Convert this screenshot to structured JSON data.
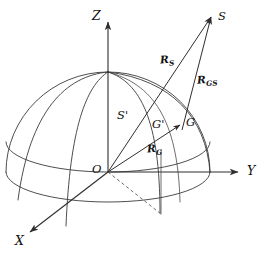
{
  "figure": {
    "background_color": "#ffffff",
    "line_color": "#3a3a3a",
    "label_color": "#111111",
    "width": 266,
    "height": 270
  },
  "axes": {
    "x": {
      "label": "X",
      "label_x": 15,
      "label_y": 236
    },
    "y": {
      "label": "Y",
      "label_x": 247,
      "label_y": 165
    },
    "z": {
      "label": "Z",
      "label_x": 92,
      "label_y": 16
    }
  },
  "points": {
    "origin": {
      "label": "O",
      "label_x": 92,
      "label_y": 165
    },
    "satellite": {
      "label": "S",
      "label_x": 217,
      "label_y": 11
    },
    "subsatellite": {
      "label": "S'",
      "label_x": 118,
      "label_y": 110
    },
    "ground_projected": {
      "label": "G'",
      "label_x": 152,
      "label_y": 120
    },
    "ground_station": {
      "label": "G",
      "label_x": 185,
      "label_y": 119
    }
  },
  "vectors": {
    "r_s": {
      "base": "R",
      "sub": "S",
      "label_x": 160,
      "label_y": 57
    },
    "r_gs": {
      "base": "R",
      "sub": "GS",
      "label_x": 198,
      "label_y": 77
    },
    "r_g": {
      "base": "R",
      "sub": "G",
      "label_x": 147,
      "label_y": 145
    }
  },
  "geometry": {
    "sphere_center_x": 108,
    "sphere_center_y": 172,
    "sphere_radius_x": 102,
    "sphere_radius_y": 100,
    "equator_ry": 28,
    "bottom_ellipse_ry": 30
  }
}
